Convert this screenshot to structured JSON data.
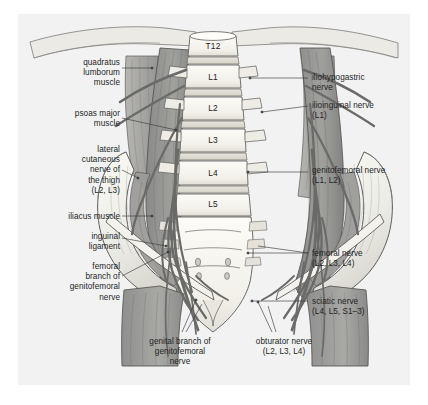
{
  "figure": {
    "panel_background": "#f2f2f2",
    "page_background": "#ffffff"
  },
  "palette": {
    "bone_light": "#f6f4ef",
    "bone_shade": "#dcd9d1",
    "muscle_mid": "#9a9a98",
    "muscle_dark": "#7e7e7c",
    "muscle_light": "#b9b8b4",
    "nerve": "#6f6f6f",
    "outline": "#4a4a4a",
    "leader": "#3c3c3c",
    "text": "#221f1f"
  },
  "vertebrae": [
    {
      "label": "T12",
      "x": 213,
      "y": 46
    },
    {
      "label": "L1",
      "x": 213,
      "y": 77
    },
    {
      "label": "L2",
      "x": 213,
      "y": 107
    },
    {
      "label": "L3",
      "x": 213,
      "y": 139
    },
    {
      "label": "L4",
      "x": 213,
      "y": 172
    },
    {
      "label": "L5",
      "x": 213,
      "y": 203
    }
  ],
  "labels_left": [
    {
      "id": "quadratus-lumborum-muscle",
      "text": "quadratus\nlumborum\nmuscle",
      "x": 38,
      "y": 58,
      "width": 82,
      "align": "right"
    },
    {
      "id": "psoas-major-muscle",
      "text": "psoas major\nmuscle",
      "x": 38,
      "y": 109,
      "width": 82,
      "align": "right"
    },
    {
      "id": "lateral-cutaneous-nerve-of-the-thigh",
      "text": "lateral\ncutaneous\nnerve of\nthe thigh\n(L2, L3)",
      "x": 38,
      "y": 145,
      "width": 82,
      "align": "right"
    },
    {
      "id": "iliacus-muscle",
      "text": "iliacus muscle",
      "x": 28,
      "y": 212,
      "width": 92,
      "align": "right"
    },
    {
      "id": "inguinal-ligament",
      "text": "inguinal\nligament",
      "x": 38,
      "y": 232,
      "width": 82,
      "align": "right"
    },
    {
      "id": "femoral-branch-of-genitofemoral-nerve",
      "text": "femoral\nbranch of\ngenitofemoral\nnerve",
      "x": 28,
      "y": 262,
      "width": 92,
      "align": "right"
    }
  ],
  "labels_right": [
    {
      "id": "iliohypogastric-nerve",
      "text": "iliohypogastric\nnerve",
      "x": 312,
      "y": 73,
      "width": 108,
      "align": "left"
    },
    {
      "id": "ilioinguinal-nerve",
      "text": "ilioinguinal nerve\n(L1)",
      "x": 312,
      "y": 101,
      "width": 108,
      "align": "left"
    },
    {
      "id": "genitofemoral-nerve",
      "text": "genitofemoral nerve\n(L1, L2)",
      "x": 312,
      "y": 166,
      "width": 112,
      "align": "left"
    },
    {
      "id": "femoral-nerve",
      "text": "femoral nerve\n(L2, L3, L4)",
      "x": 312,
      "y": 249,
      "width": 108,
      "align": "left"
    },
    {
      "id": "sciatic-nerve",
      "text": "sciatic nerve\n(L4, L5, S1–3)",
      "x": 312,
      "y": 297,
      "width": 108,
      "align": "left"
    }
  ],
  "labels_bottom": [
    {
      "id": "genital-branch-of-genitofemoral-nerve",
      "text": "genital branch of\ngenitofemoral\nnerve",
      "x": 128,
      "y": 337,
      "width": 104,
      "align": "center"
    },
    {
      "id": "obturator-nerve",
      "text": "obturator nerve\n(L2, L3, L4)",
      "x": 236,
      "y": 337,
      "width": 96,
      "align": "center"
    }
  ]
}
